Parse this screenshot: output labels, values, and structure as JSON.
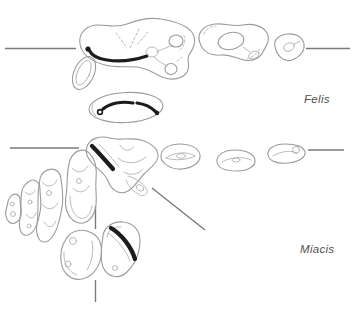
{
  "figure": {
    "background": "#ffffff",
    "rows": [
      {
        "label": "Felis"
      },
      {
        "label": "Miacis"
      }
    ]
  },
  "colors": {
    "background": "#ffffff",
    "tooth_outline": "#9b9b9b",
    "inner_detail": "#a9a9a9",
    "shear_blade": "#1c1c1c",
    "reference_line": "#7a7a7a",
    "label_text": "#4f4f4f"
  }
}
